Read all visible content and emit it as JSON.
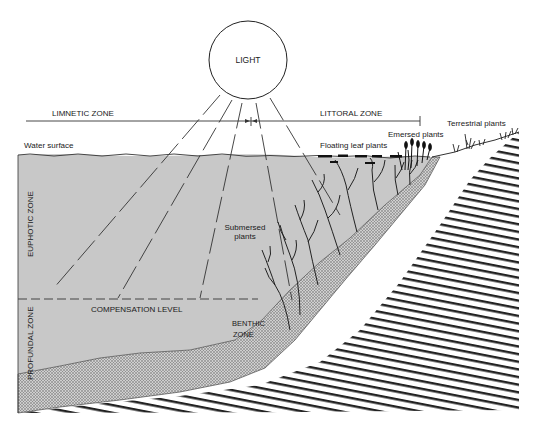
{
  "diagram": {
    "type": "lake-zonation-cross-section",
    "light": {
      "label": "LIGHT"
    },
    "horizontal_zones": {
      "limnetic": "LIMNETIC ZONE",
      "littoral": "LITTORAL ZONE"
    },
    "vertical_zones": {
      "euphotic": "EUPHOTIC ZONE",
      "profundal": "PROFUNDAL ZONE"
    },
    "labels": {
      "water_surface": "Water surface",
      "floating_leaf_plants": "Floating leaf plants",
      "emersed_plants": "Emersed plants",
      "terrestrial_plants": "Terrestrial plants",
      "submersed_plants_line1": "Submersed",
      "submersed_plants_line2": "plants",
      "compensation_level": "COMPENSATION LEVEL",
      "benthic_line1": "BENTHIC",
      "benthic_line2": "ZONE"
    },
    "colors": {
      "water": "#c8c8c8",
      "benthic": "#b4b4b4",
      "line": "#1a1a1a",
      "background": "#ffffff"
    }
  }
}
